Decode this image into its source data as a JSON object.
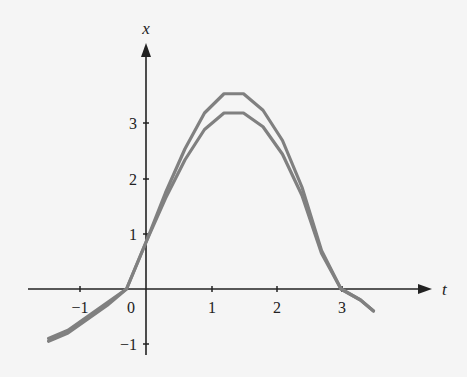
{
  "chart_data": {
    "type": "line",
    "title": "",
    "xlabel": "t",
    "ylabel": "x",
    "xlim": [
      -1.6,
      4.2
    ],
    "ylim": [
      -1.1,
      4.0
    ],
    "xticks": [
      -1,
      0,
      1,
      2,
      3
    ],
    "yticks": [
      -1,
      1,
      2,
      3
    ],
    "tick_labels": {
      "x": [
        "−1",
        "0",
        "1",
        "2",
        "3"
      ],
      "y": [
        "−1",
        "1",
        "2",
        "3"
      ]
    },
    "grid": false,
    "legend": null,
    "series": [
      {
        "name": "upper curve",
        "color": "#808080",
        "points": [
          [
            -1.5,
            -0.95
          ],
          [
            -1.2,
            -0.8
          ],
          [
            -0.9,
            -0.55
          ],
          [
            -0.6,
            -0.3
          ],
          [
            -0.3,
            0
          ],
          [
            0,
            0.85
          ],
          [
            0.3,
            1.75
          ],
          [
            0.6,
            2.55
          ],
          [
            0.9,
            3.2
          ],
          [
            1.2,
            3.55
          ],
          [
            1.5,
            3.55
          ],
          [
            1.8,
            3.25
          ],
          [
            2.1,
            2.7
          ],
          [
            2.4,
            1.85
          ],
          [
            2.7,
            0.7
          ],
          [
            3.0,
            0
          ],
          [
            3.3,
            -0.2
          ],
          [
            3.5,
            -0.4
          ]
        ]
      },
      {
        "name": "lower curve",
        "color": "#808080",
        "points": [
          [
            -1.5,
            -0.9
          ],
          [
            -1.2,
            -0.75
          ],
          [
            -0.9,
            -0.5
          ],
          [
            -0.6,
            -0.25
          ],
          [
            -0.3,
            0
          ],
          [
            0,
            0.85
          ],
          [
            0.3,
            1.65
          ],
          [
            0.6,
            2.35
          ],
          [
            0.9,
            2.9
          ],
          [
            1.2,
            3.2
          ],
          [
            1.5,
            3.2
          ],
          [
            1.8,
            2.95
          ],
          [
            2.1,
            2.45
          ],
          [
            2.4,
            1.7
          ],
          [
            2.7,
            0.65
          ],
          [
            3.0,
            0
          ],
          [
            3.3,
            -0.2
          ],
          [
            3.5,
            -0.4
          ]
        ]
      }
    ]
  },
  "labels": {
    "x_axis": "t",
    "y_axis": "x",
    "xt_m1": "−1",
    "xt_0": "0",
    "xt_1": "1",
    "xt_2": "2",
    "xt_3": "3",
    "yt_m1": "−1",
    "yt_1": "1",
    "yt_2": "2",
    "yt_3": "3"
  }
}
